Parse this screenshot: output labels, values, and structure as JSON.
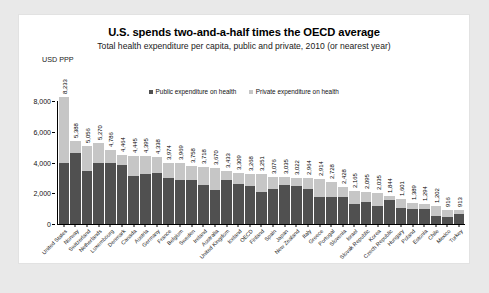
{
  "chart_data": {
    "type": "bar",
    "title": "U.S. spends two-and-a-half times the OECD average",
    "subtitle": "Total health expenditure per capita, public and private, 2010 (or nearest year)",
    "ylabel": "USD PPP",
    "xlabel": "",
    "grid": false,
    "legend_position": "top-center",
    "ylim": [
      0,
      8000
    ],
    "yticks": [
      "0",
      "2,000",
      "4,000",
      "6,000",
      "8,000"
    ],
    "ytick_values": [
      0,
      2000,
      4000,
      6000,
      8000
    ],
    "legend": [
      {
        "label": "Public expenditure on health",
        "color": "#505050"
      },
      {
        "label": "Private expenditure on health",
        "color": "#c6c6c6"
      }
    ],
    "categories": [
      "United States",
      "Norway",
      "Switzerland",
      "Netherlands",
      "Luxembourg",
      "Denmark",
      "Canada",
      "Austria",
      "Germany",
      "France",
      "Belgium",
      "Sweden",
      "Ireland",
      "Australia",
      "United Kingdom",
      "Iceland",
      "OECD",
      "Finland",
      "Spain",
      "Japan",
      "New Zealand",
      "Italy",
      "Greece",
      "Portugal",
      "Slovenia",
      "Israel",
      "Slovak Republic",
      "Korea",
      "Czech Republic",
      "Hungary",
      "Poland",
      "Estonia",
      "Chile",
      "Mexico",
      "Turkey"
    ],
    "labels": [
      "8,233",
      "5,388",
      "5,056",
      "5,270",
      "4,786",
      "4,464",
      "4,445",
      "4,395",
      "4,338",
      "3,974",
      "3,969",
      "3,758",
      "3,718",
      "3,670",
      "3,433",
      "3,309",
      "3,268",
      "3,251",
      "3,076",
      "3,035",
      "3,022",
      "2,964",
      "2,914",
      "2,728",
      "2,428",
      "2,165",
      "2,095",
      "2,035",
      "1,844",
      "1,601",
      "1,389",
      "1,294",
      "1,202",
      "916",
      "913"
    ],
    "values": [
      8233,
      5388,
      5056,
      5270,
      4786,
      4464,
      4445,
      4395,
      4338,
      3974,
      3969,
      3758,
      3718,
      3670,
      3433,
      3309,
      3268,
      3251,
      3076,
      3035,
      3022,
      2964,
      2914,
      2728,
      2428,
      2165,
      2095,
      2035,
      1844,
      1601,
      1389,
      1294,
      1202,
      916,
      913
    ],
    "series": [
      {
        "name": "Public expenditure on health",
        "color": "#505050",
        "values": [
          3967,
          4600,
          3430,
          4000,
          4000,
          3850,
          3100,
          3270,
          3300,
          3000,
          2860,
          2890,
          2540,
          2200,
          2860,
          2600,
          2470,
          2110,
          2270,
          2560,
          2470,
          2280,
          1770,
          1780,
          1760,
          1290,
          1430,
          1180,
          1560,
          1050,
          1000,
          980,
          510,
          440,
          680
        ]
      },
      {
        "name": "Private expenditure on health",
        "color": "#c6c6c6",
        "values": [
          4266,
          788,
          1626,
          1270,
          786,
          614,
          1345,
          1125,
          1038,
          974,
          1109,
          868,
          1178,
          1470,
          573,
          709,
          798,
          1141,
          806,
          475,
          552,
          684,
          1144,
          948,
          668,
          875,
          665,
          855,
          284,
          551,
          389,
          314,
          692,
          476,
          233
        ]
      }
    ]
  }
}
